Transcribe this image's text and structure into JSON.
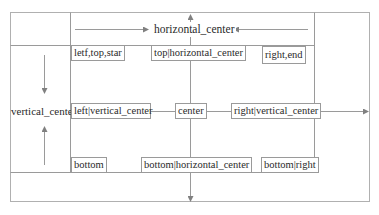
{
  "diagram": {
    "colors": {
      "line": "#9a9a9a",
      "frame": "#b0b0b0",
      "text": "#2a2a2a",
      "arrow": "#808080"
    },
    "axis_labels": {
      "horizontal": "horizontal_center",
      "vertical": "vertical_center"
    },
    "boxes": {
      "top_left": "letf,top,star",
      "top_center": "top|horizontal_center",
      "top_right": "right,end",
      "middle_left": "left|vertical_center",
      "center": "center",
      "middle_right": "right|vertical_center",
      "bottom_left": "bottom",
      "bottom_center": "bottom|horizontal_center",
      "bottom_right": "bottom|right"
    }
  }
}
